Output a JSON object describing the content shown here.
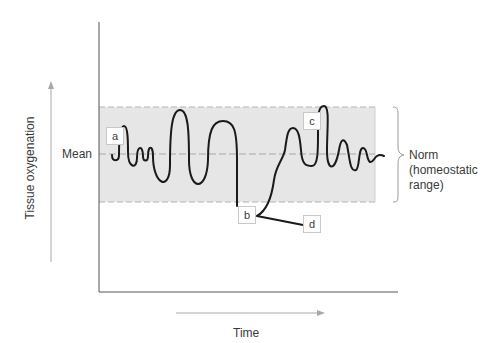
{
  "diagram": {
    "y_axis_label": "Tissue oxygenation",
    "x_axis_label": "Time",
    "mean_label": "Mean",
    "norm_label_line1": "Norm",
    "norm_label_line2": "(homeostatic",
    "norm_label_line3": "range)",
    "markers": {
      "a": "a",
      "b": "b",
      "c": "c",
      "d": "d"
    },
    "colors": {
      "band_fill": "#e6e6e6",
      "band_border": "#b0b0b0",
      "axis": "#555555",
      "curve": "#1a1a1a",
      "arrow": "#a8a8a8",
      "text": "#3a3a3a"
    }
  }
}
